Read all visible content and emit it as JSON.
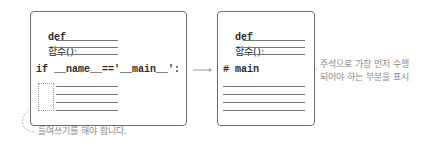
{
  "left_box": {
    "def_keyword": "def",
    "def_name": "함수():",
    "if_statement": "if __name__=='__main__':"
  },
  "right_box": {
    "def_keyword": "def",
    "def_name": "함수():",
    "comment": "# main"
  },
  "annotations": {
    "indent_note": "들여쓰기를 해야 합니다.",
    "comment_note_line1": "주석으로 가장 먼저 수행",
    "comment_note_line2": "되어야 하는 부분을 표시"
  },
  "colors": {
    "border": "#6d6d6d",
    "text": "#2a2a2a",
    "note": "#8a8a8a"
  }
}
